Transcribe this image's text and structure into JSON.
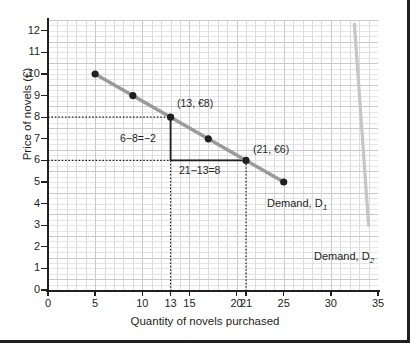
{
  "chart_data": {
    "type": "line",
    "title": "",
    "xlabel": "Quantity of novels purchased",
    "ylabel": "Price of novels (€)",
    "xlim": [
      0,
      35
    ],
    "ylim": [
      0,
      12.5
    ],
    "grid": true,
    "legend_position": "inline-labels",
    "xticks": [
      0,
      5,
      10,
      13,
      15,
      20,
      21,
      25,
      30,
      35
    ],
    "xticklabels": [
      "0",
      "5",
      "10",
      "13",
      "15",
      "20",
      "21",
      "25",
      "30",
      "35"
    ],
    "yticks": [
      0,
      1,
      2,
      3,
      4,
      5,
      6,
      7,
      8,
      9,
      10,
      11,
      12
    ],
    "yticklabels": [
      "0",
      "1",
      "2",
      "3",
      "4",
      "5",
      "6",
      "7",
      "8",
      "9",
      "10",
      "11",
      "12"
    ],
    "series": [
      {
        "name": "Demand, D1",
        "label": "Demand, D",
        "subscript": "1",
        "color": "#9a9a9a",
        "marker_color": "#231f20",
        "x": [
          5,
          9,
          13,
          17,
          21,
          25
        ],
        "y": [
          10,
          9,
          8,
          7,
          6,
          5
        ]
      },
      {
        "name": "Demand, D2",
        "label": "Demand, D",
        "subscript": "2",
        "color": "#c6c6c6",
        "marker_color": "#c6c6c6",
        "x": [
          32.5,
          34.0
        ],
        "y": [
          12.3,
          3.0
        ]
      }
    ],
    "annotations": [
      {
        "id": "point-label-13-8",
        "text": "(13, €8)",
        "x": 13,
        "y": 8
      },
      {
        "id": "point-label-21-6",
        "text": "(21, €6)",
        "x": 21,
        "y": 6
      },
      {
        "id": "rise-label",
        "text": "6−8=−2",
        "x": 13,
        "y": 7
      },
      {
        "id": "run-label",
        "text": "21−13=8",
        "x": 17,
        "y": 6
      }
    ],
    "guide_lines": [
      {
        "id": "hline-price-8",
        "type": "horizontal-dotted",
        "y": 8,
        "from_x": 0,
        "to_x": 13
      },
      {
        "id": "hline-price-6",
        "type": "horizontal-dotted",
        "y": 6,
        "from_x": 0,
        "to_x": 21
      },
      {
        "id": "vline-qty-13",
        "type": "vertical-dotted",
        "x": 13,
        "from_y": 0,
        "to_y": 8
      },
      {
        "id": "vline-qty-21",
        "type": "vertical-dotted",
        "x": 21,
        "from_y": 0,
        "to_y": 6
      },
      {
        "id": "rise-segment",
        "type": "vertical-solid",
        "x": 13,
        "from_y": 6,
        "to_y": 8
      },
      {
        "id": "run-segment",
        "type": "horizontal-solid",
        "y": 6,
        "from_x": 13,
        "to_x": 21
      }
    ],
    "colors": {
      "demand1_line": "#9a9a9a",
      "demand2_line": "#c6c6c6",
      "marker": "#231f20",
      "axis": "#231f20",
      "grid_major": "#c9c9cf",
      "grid_minor": "#e4e4e9",
      "border": "#231f20"
    }
  }
}
